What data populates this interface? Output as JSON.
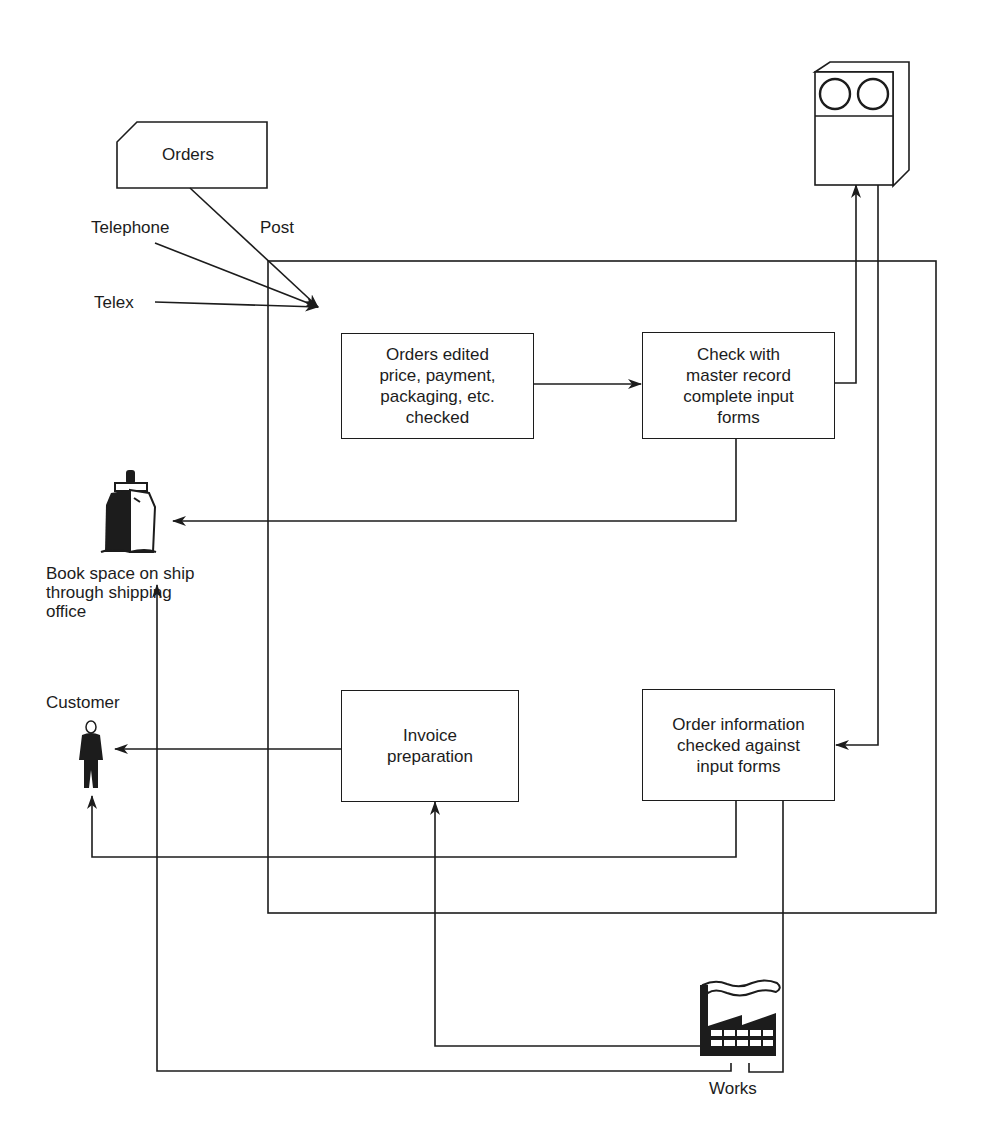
{
  "inputs": {
    "orders_card": "Orders",
    "telephone": "Telephone",
    "post": "Post",
    "telex": "Telex"
  },
  "process_boxes": {
    "orders_edited": "Orders edited\nprice, payment,\npackaging, etc.\nchecked",
    "check_master": "Check with\nmaster record\ncomplete input\nforms",
    "invoice": "Invoice\npreparation",
    "order_info": "Order information\nchecked against\ninput forms"
  },
  "external": {
    "ship_label": "Book space on ship\nthrough shipping\noffice",
    "customer_label": "Customer",
    "works_label": "Works"
  },
  "icons": {
    "computer": "computer-tape-unit-icon",
    "ship": "ship-icon",
    "customer": "person-icon",
    "works": "factory-icon"
  },
  "colors": {
    "ink": "#1c1c1c",
    "background": "#ffffff"
  }
}
